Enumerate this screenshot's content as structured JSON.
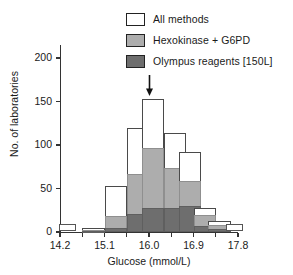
{
  "chart_data": {
    "type": "bar",
    "title": "",
    "subtitle": "",
    "xlabel": "Glucose (mmol/L)",
    "ylabel": "No. of laboratories",
    "xlim": [
      14.2,
      17.8
    ],
    "ylim": [
      0,
      215
    ],
    "xticks": [
      14.2,
      15.1,
      16.0,
      16.9,
      17.8
    ],
    "xtick_labels": [
      "14.2",
      "15.1",
      "16.0",
      "16.9",
      "17.8"
    ],
    "xminor_step": 0.45,
    "yticks": [
      0,
      50,
      100,
      150,
      200
    ],
    "ytick_labels": [
      "0",
      "50",
      "100",
      "150",
      "200"
    ],
    "grid": false,
    "legend_position": "top-right",
    "stacked": true,
    "bin_width": 0.45,
    "bin_starts": [
      14.65,
      15.1,
      15.55,
      15.85,
      16.3,
      16.6,
      16.9,
      17.2
    ],
    "bin_labels": [
      "14.65-15.10",
      "15.10-15.55",
      "15.55-15.85",
      "15.85-16.30",
      "16.30-16.60",
      "16.60-16.90",
      "16.90-17.20",
      "17.20-17.50"
    ],
    "series": [
      {
        "name": "All methods",
        "color": "#ffffff",
        "edge": "#4a4a4a",
        "values": [
          5,
          53,
          120,
          153,
          114,
          92,
          28,
          13
        ]
      },
      {
        "name": "Hexokinase + G6PD",
        "color": "#adadad",
        "edge": "#8f8f8f",
        "values": [
          2,
          18,
          67,
          97,
          74,
          59,
          19,
          8
        ]
      },
      {
        "name": "Olympus reagents [150L]",
        "color": "#6e6e6e",
        "edge": "#5f5f5f",
        "values": [
          1,
          5,
          21,
          28,
          28,
          30,
          7,
          3
        ]
      }
    ],
    "annotations": [
      {
        "name": "target-value-arrow",
        "type": "arrow",
        "x": 16.0,
        "points": "down",
        "label": ""
      },
      {
        "name": "low-outlier-marker",
        "type": "box",
        "x": 14.35,
        "y": 3
      },
      {
        "name": "high-outlier-marker",
        "type": "box",
        "x": 17.72,
        "y": 3
      }
    ]
  },
  "legend": {
    "items": [
      {
        "label": "All methods",
        "swatch": "#ffffff"
      },
      {
        "label": "Hexokinase + G6PD",
        "swatch": "#adadad"
      },
      {
        "label": "Olympus reagents [150L]",
        "swatch": "#6e6e6e"
      }
    ]
  }
}
